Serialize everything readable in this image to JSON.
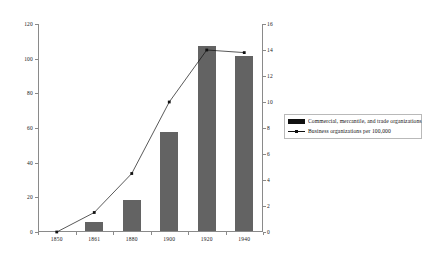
{
  "chart_data": {
    "type": "bar",
    "title": "",
    "subtitle": "",
    "xlabel": "",
    "ylabel": "",
    "categories": [
      "1850",
      "1861",
      "1880",
      "1900",
      "1920",
      "1940"
    ],
    "grid": false,
    "legend_position": "right-middle",
    "axes": {
      "left": {
        "ylabel": "",
        "ylim": [
          0,
          120
        ],
        "ticks": [
          0,
          20,
          40,
          60,
          80,
          100,
          120
        ],
        "tick_labels": [
          "0",
          "20",
          "40",
          "60",
          "80",
          "100",
          "120"
        ]
      },
      "right": {
        "ylabel": "",
        "ylim": [
          0,
          16
        ],
        "ticks": [
          0,
          2,
          4,
          6,
          8,
          10,
          12,
          14,
          16
        ],
        "tick_labels": [
          "0",
          "2",
          "4",
          "6",
          "8",
          "10",
          "12",
          "14",
          "16"
        ]
      }
    },
    "series": [
      {
        "name": "Commercial, mercantile, and trade organizations",
        "type": "bar",
        "axis": "left",
        "color": "#636363",
        "values": [
          0,
          5,
          18,
          57,
          107,
          101
        ]
      },
      {
        "name": "Business organizations per 100,000",
        "type": "line",
        "axis": "right",
        "color": "#111111",
        "marker": "square",
        "values": [
          0,
          1.5,
          4.5,
          10.0,
          14.0,
          13.8
        ]
      }
    ]
  },
  "legend": {
    "items": [
      {
        "label": "Commercial, mercantile, and trade organizations",
        "swatch": "bar-swatch"
      },
      {
        "label": "Business organizations per 100,000",
        "swatch": "line-marker-swatch"
      }
    ]
  },
  "colors": {
    "bar": "#636363",
    "line": "#111111",
    "axis": "#8a8a8a",
    "background": "#ffffff"
  }
}
